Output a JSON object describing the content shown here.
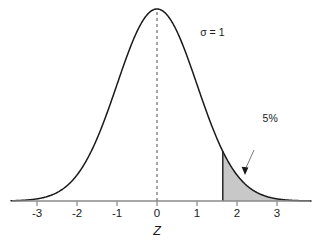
{
  "chart_data": {
    "type": "area",
    "title": "",
    "xlabel": "Z",
    "ylabel": "",
    "xlim": [
      -3.65,
      3.85
    ],
    "ylim": [
      0,
      0.42
    ],
    "grid": false,
    "legend": null,
    "distribution": {
      "name": "standard normal",
      "mean": 0,
      "sigma": 1
    },
    "xticks": [
      -3,
      -2,
      -1,
      0,
      1,
      2,
      3
    ],
    "xtick_labels": [
      "-3",
      "-2",
      "-1",
      "0",
      "1",
      "2",
      "3"
    ],
    "curve": {
      "x": [
        -3.65,
        -3.5,
        -3.25,
        -3,
        -2.75,
        -2.5,
        -2.25,
        -2,
        -1.75,
        -1.5,
        -1.25,
        -1,
        -0.75,
        -0.5,
        -0.25,
        0,
        0.25,
        0.5,
        0.75,
        1,
        1.25,
        1.5,
        1.75,
        2,
        2.25,
        2.5,
        2.75,
        3,
        3.25,
        3.5,
        3.65
      ],
      "y": [
        0.0005,
        0.0009,
        0.002,
        0.0044,
        0.0091,
        0.0175,
        0.0317,
        0.054,
        0.0863,
        0.1295,
        0.1826,
        0.242,
        0.3011,
        0.3521,
        0.3867,
        0.3989,
        0.3867,
        0.3521,
        0.3011,
        0.242,
        0.1826,
        0.1295,
        0.0863,
        0.054,
        0.0317,
        0.0175,
        0.0091,
        0.0044,
        0.002,
        0.0009,
        0.0005
      ]
    },
    "shaded_region": {
      "label": "5%",
      "area_fraction": 0.05,
      "z_lower": 1.645,
      "z_upper": 3.65,
      "fill_color": "#c8c8c8"
    },
    "center_line": {
      "z": 0,
      "style": "dashed"
    },
    "annotations": [
      {
        "id": "sigma",
        "text": "σ = 1",
        "z": 1.08,
        "y_frac": 0.86
      },
      {
        "id": "tail-callout",
        "text": "5%",
        "z": 2.64,
        "y_frac": 0.41
      }
    ],
    "colors": {
      "curve": "#1a1a1a",
      "axis": "#8a8a8a",
      "shade": "#c8c8c8",
      "dashed": "#4d4d4d",
      "text": "#1a1a1a",
      "background": "#ffffff"
    }
  }
}
